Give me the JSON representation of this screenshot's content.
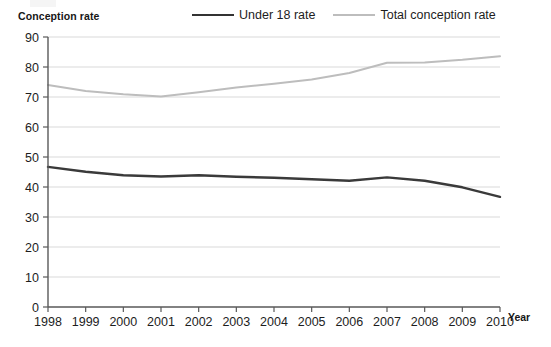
{
  "chart_data": {
    "type": "line",
    "title": "",
    "ylabel": "Conception rate",
    "xlabel": "Year",
    "x": [
      1998,
      1999,
      2000,
      2001,
      2002,
      2003,
      2004,
      2005,
      2006,
      2007,
      2008,
      2009,
      2010
    ],
    "categories": [
      "1998",
      "1999",
      "2000",
      "2001",
      "2002",
      "2003",
      "2004",
      "2005",
      "2006",
      "2007",
      "2008",
      "2009",
      "2010"
    ],
    "series": [
      {
        "name": "Under 18 rate",
        "color": "#3a3a3a",
        "values": [
          46.7,
          45.1,
          43.9,
          43.5,
          43.9,
          43.4,
          43.1,
          42.6,
          42.1,
          43.2,
          42.1,
          39.9,
          36.7
        ]
      },
      {
        "name": "Total conception rate",
        "color": "#bdbdbd",
        "values": [
          74.0,
          72.0,
          70.9,
          70.2,
          71.6,
          73.2,
          74.4,
          75.8,
          78.0,
          81.4,
          81.5,
          82.4,
          83.6
        ]
      }
    ],
    "ylim": [
      0,
      90
    ],
    "yticks": [
      0,
      10,
      20,
      30,
      40,
      50,
      60,
      70,
      80,
      90
    ],
    "ytick_labels": [
      "0",
      "10",
      "20",
      "30",
      "40",
      "50",
      "60",
      "70",
      "80",
      "90"
    ],
    "grid": true,
    "grid_color": "#d9d9d9",
    "axis_color": "#595959",
    "legend_position": "top",
    "legend": [
      "Under 18 rate",
      "Total conception rate"
    ]
  },
  "axis_titles": {
    "y": "Conception rate",
    "x": "Year"
  },
  "legend": {
    "items": [
      {
        "label": "Under 18 rate",
        "swatch": "dark-line-swatch"
      },
      {
        "label": "Total conception rate",
        "swatch": "light-line-swatch"
      }
    ]
  }
}
